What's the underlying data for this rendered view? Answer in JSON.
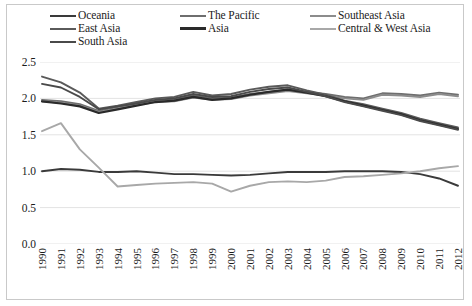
{
  "chart_data": {
    "type": "line",
    "title": "",
    "xlabel": "",
    "ylabel": "",
    "ylim": [
      0.0,
      2.5
    ],
    "xlim": [
      1990,
      2012
    ],
    "grid": true,
    "legend_position": "top",
    "ytick_labels": [
      "2.5",
      "2.0",
      "1.5",
      "1.0",
      "0.5",
      "0.0"
    ],
    "ytick_values": [
      2.5,
      2.0,
      1.5,
      1.0,
      0.5,
      0.0
    ],
    "x": [
      1990,
      1991,
      1992,
      1993,
      1994,
      1995,
      1996,
      1997,
      1998,
      1999,
      2000,
      2001,
      2002,
      2003,
      2004,
      2005,
      2006,
      2007,
      2008,
      2009,
      2010,
      2011,
      2012
    ],
    "xtick_labels": [
      "1990",
      "1991",
      "1992",
      "1993",
      "1994",
      "1995",
      "1996",
      "1997",
      "1998",
      "1999",
      "2000",
      "2001",
      "2002",
      "2003",
      "2004",
      "2005",
      "2006",
      "2007",
      "2008",
      "2009",
      "2010",
      "2011",
      "2012"
    ],
    "series": [
      {
        "name": "Oceania",
        "color": "#3a3a3a",
        "width": 1.9,
        "values": [
          1.0,
          1.03,
          1.02,
          0.99,
          0.99,
          1.0,
          0.98,
          0.96,
          0.96,
          0.95,
          0.94,
          0.95,
          0.97,
          0.99,
          0.99,
          0.99,
          1.0,
          1.0,
          1.0,
          0.99,
          0.96,
          0.9,
          0.8
        ]
      },
      {
        "name": "The Pacific",
        "color": "#6e6e6e",
        "width": 1.9,
        "values": [
          1.98,
          1.96,
          1.92,
          1.83,
          1.88,
          1.93,
          1.97,
          1.99,
          2.04,
          2.0,
          2.01,
          2.06,
          2.09,
          2.12,
          2.09,
          2.06,
          2.02,
          2.0,
          2.07,
          2.06,
          2.04,
          2.08,
          2.05
        ]
      },
      {
        "name": "Southeast Asia",
        "color": "#8c8c8c",
        "width": 1.9,
        "values": [
          1.96,
          1.94,
          1.9,
          1.81,
          1.86,
          1.91,
          1.95,
          1.96,
          2.01,
          1.98,
          1.99,
          2.04,
          2.07,
          2.1,
          2.07,
          2.04,
          2.0,
          1.98,
          2.05,
          2.04,
          2.02,
          2.06,
          2.03
        ]
      },
      {
        "name": "East Asia",
        "color": "#5a5a5a",
        "width": 1.9,
        "values": [
          2.3,
          2.22,
          2.08,
          1.86,
          1.9,
          1.95,
          2.0,
          2.02,
          2.09,
          2.04,
          2.06,
          2.12,
          2.16,
          2.18,
          2.11,
          2.05,
          1.97,
          1.92,
          1.86,
          1.8,
          1.72,
          1.66,
          1.6
        ]
      },
      {
        "name": "Asia",
        "color": "#2a2a2a",
        "width": 2.2,
        "values": [
          1.96,
          1.93,
          1.89,
          1.8,
          1.85,
          1.9,
          1.95,
          1.97,
          2.02,
          1.98,
          2.0,
          2.05,
          2.09,
          2.12,
          2.08,
          2.03,
          1.96,
          1.9,
          1.84,
          1.78,
          1.7,
          1.64,
          1.58
        ]
      },
      {
        "name": "Central & West Asia",
        "color": "#a8a8a8",
        "width": 1.9,
        "values": [
          1.55,
          1.66,
          1.3,
          1.05,
          0.79,
          0.81,
          0.83,
          0.84,
          0.85,
          0.83,
          0.72,
          0.8,
          0.85,
          0.86,
          0.85,
          0.87,
          0.92,
          0.93,
          0.95,
          0.97,
          1.0,
          1.04,
          1.07
        ]
      },
      {
        "name": "South Asia",
        "color": "#4a4a4a",
        "width": 1.9,
        "values": [
          2.2,
          2.15,
          2.02,
          1.85,
          1.89,
          1.93,
          1.98,
          2.0,
          2.06,
          2.02,
          2.03,
          2.09,
          2.13,
          2.15,
          2.09,
          2.03,
          1.95,
          1.89,
          1.83,
          1.77,
          1.69,
          1.63,
          1.57
        ]
      }
    ],
    "legend": [
      {
        "label": "Oceania",
        "color": "#3a3a3a",
        "width": 1.9
      },
      {
        "label": "The Pacific",
        "color": "#6e6e6e",
        "width": 1.9
      },
      {
        "label": "Southeast Asia",
        "color": "#8c8c8c",
        "width": 1.9
      },
      {
        "label": "East Asia",
        "color": "#5a5a5a",
        "width": 1.9
      },
      {
        "label": "Asia",
        "color": "#2a2a2a",
        "width": 2.4
      },
      {
        "label": "Central & West Asia",
        "color": "#a8a8a8",
        "width": 1.6
      },
      {
        "label": "South Asia",
        "color": "#4a4a4a",
        "width": 1.9
      }
    ]
  },
  "style": {
    "gridline_color": "#e3e3e3",
    "frame_color": "#c9c9c9",
    "text_color": "#1b1b1b",
    "background": "#ffffff"
  }
}
